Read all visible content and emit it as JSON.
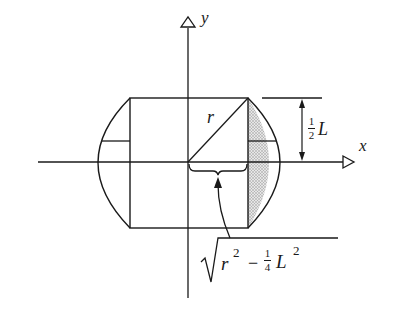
{
  "diagram": {
    "type": "geometry-cross-section",
    "axes": {
      "x_label": "x",
      "y_label": "y"
    },
    "labels": {
      "radius": "r",
      "half_height_num": "1",
      "half_height_den": "2",
      "half_height_var": "L",
      "formula_r": "r",
      "formula_r_exp": "2",
      "formula_minus": "−",
      "formula_frac_num": "1",
      "formula_frac_den": "4",
      "formula_L": "L",
      "formula_L_exp": "2"
    },
    "colors": {
      "stroke": "#1a1a1a",
      "shade": "#bdbdbd",
      "background": "#ffffff"
    }
  }
}
